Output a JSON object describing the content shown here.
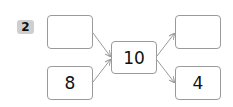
{
  "problem": {
    "number": "2",
    "inputs": [
      "",
      "8"
    ],
    "center": "10",
    "outputs": [
      "",
      "4"
    ]
  },
  "colors": {
    "badge_bg": "#cfcfcf",
    "box_border": "#9a9a9a",
    "arrow": "#9a9a9a"
  }
}
